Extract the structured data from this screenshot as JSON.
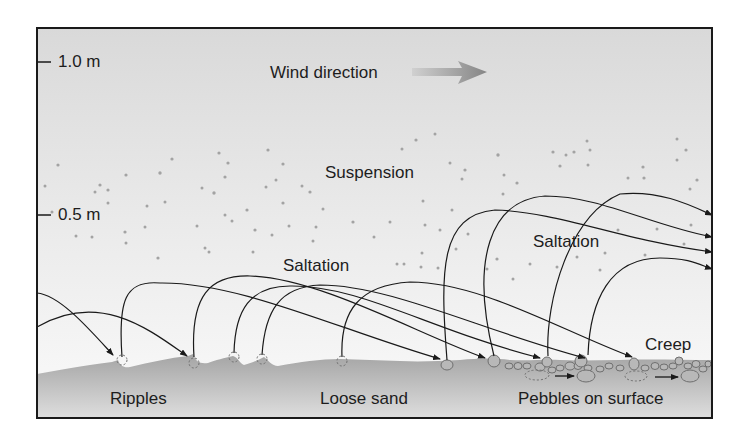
{
  "scale": {
    "ticks": [
      {
        "label": "1.0 m",
        "y": 62
      },
      {
        "label": "0.5 m",
        "y": 215
      }
    ]
  },
  "labels": {
    "wind_direction": "Wind direction",
    "suspension": "Suspension",
    "saltation_left": "Saltation",
    "saltation_right": "Saltation",
    "creep": "Creep",
    "ripples": "Ripples",
    "loose_sand": "Loose sand",
    "pebbles": "Pebbles on surface"
  },
  "colors": {
    "frame": "#1a1a1a",
    "sky_top": "#dcdcdc",
    "sky_bottom": "#f7f7f7",
    "ground": "#a9a9a9",
    "ground_dark": "#8e8e8e",
    "particle": "#a0a0a0",
    "trajectory": "#1a1a1a",
    "wind_arrow": "#8d8d8d"
  }
}
